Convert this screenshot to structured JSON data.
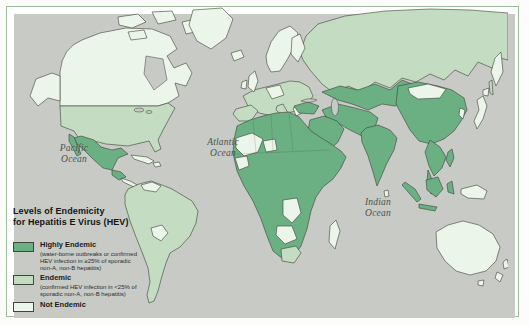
{
  "figure": {
    "type": "choropleth-world-map",
    "subject": "Levels of Endemicity for Hepatitis E Virus (HEV)"
  },
  "legend": {
    "title_line1": "Levels of Endemicity",
    "title_line2": "for Hepatitis E Virus (HEV)",
    "items": [
      {
        "label": "Highly Endemic",
        "description": "(water-borne outbreaks or confirmed HEV infection in ≥25% of sporadic non-A, non-B hepatitis)",
        "color": "#6bb083",
        "level": "high"
      },
      {
        "label": "Endemic",
        "description": "(confirmed HEV infection in <25% of sporadic non-A, non-B hepatitis)",
        "color": "#c4dcc2",
        "level": "endemic"
      },
      {
        "label": "Not Endemic",
        "description": "",
        "color": "#ecf5ea",
        "level": "none"
      }
    ]
  },
  "ocean_labels": [
    {
      "name": "pacific-ocean",
      "line1": "Pacific",
      "line2": "Ocean"
    },
    {
      "name": "atlantic-ocean",
      "line1": "Atlantic",
      "line2": "Ocean"
    },
    {
      "name": "indian-ocean",
      "line1": "Indian",
      "line2": "Ocean"
    }
  ],
  "map": {
    "ocean_color": "#c7cac5",
    "coastline_color": "#3c3f37",
    "frame_color": "#9cbd9c",
    "levels": {
      "high": "#6bb083",
      "endemic": "#c4dcc2",
      "none": "#ecf5ea",
      "water": "#c7cac5"
    },
    "regions": [
      {
        "name": "russia",
        "level": "endemic"
      },
      {
        "name": "kamchatka",
        "level": "none"
      },
      {
        "name": "sakhalin",
        "level": "endemic"
      },
      {
        "name": "europe",
        "level": "endemic"
      },
      {
        "name": "iberia",
        "level": "endemic"
      },
      {
        "name": "italy",
        "level": "endemic"
      },
      {
        "name": "central-europe",
        "level": "none"
      },
      {
        "name": "scandinavia",
        "level": "none"
      },
      {
        "name": "finland",
        "level": "none"
      },
      {
        "name": "uk",
        "level": "none"
      },
      {
        "name": "ireland",
        "level": "none"
      },
      {
        "name": "iceland",
        "level": "none"
      },
      {
        "name": "greece",
        "level": "none"
      },
      {
        "name": "turkey",
        "level": "high"
      },
      {
        "name": "central-asia",
        "level": "high"
      },
      {
        "name": "iran-pakistan",
        "level": "high"
      },
      {
        "name": "arabia",
        "level": "high"
      },
      {
        "name": "china",
        "level": "high"
      },
      {
        "name": "mongolia",
        "level": "none"
      },
      {
        "name": "korea",
        "level": "none"
      },
      {
        "name": "india",
        "level": "high"
      },
      {
        "name": "sri-lanka",
        "level": "none"
      },
      {
        "name": "indochina",
        "level": "high"
      },
      {
        "name": "malay-peninsula",
        "level": "high"
      },
      {
        "name": "japan",
        "level": "none"
      },
      {
        "name": "philippines",
        "level": "high"
      },
      {
        "name": "sumatra",
        "level": "high"
      },
      {
        "name": "java",
        "level": "high"
      },
      {
        "name": "borneo",
        "level": "high"
      },
      {
        "name": "sulawesi",
        "level": "high"
      },
      {
        "name": "new-guinea",
        "level": "none"
      },
      {
        "name": "australia",
        "level": "none"
      },
      {
        "name": "tasmania",
        "level": "none"
      },
      {
        "name": "new-zealand",
        "level": "none"
      },
      {
        "name": "africa",
        "level": "high"
      },
      {
        "name": "sahel-west",
        "level": "none"
      },
      {
        "name": "guinea-coast",
        "level": "none"
      },
      {
        "name": "niger",
        "level": "none"
      },
      {
        "name": "congo",
        "level": "none"
      },
      {
        "name": "angola-zambia",
        "level": "none"
      },
      {
        "name": "south-africa",
        "level": "endemic"
      },
      {
        "name": "madagascar",
        "level": "none"
      },
      {
        "name": "canada",
        "level": "none"
      },
      {
        "name": "arctic-islands",
        "level": "none"
      },
      {
        "name": "greenland",
        "level": "none"
      },
      {
        "name": "alaska",
        "level": "none"
      },
      {
        "name": "usa",
        "level": "endemic"
      },
      {
        "name": "mexico",
        "level": "high"
      },
      {
        "name": "guatemala",
        "level": "high"
      },
      {
        "name": "central-america",
        "level": "none"
      },
      {
        "name": "cuba",
        "level": "none"
      },
      {
        "name": "hispaniola",
        "level": "none"
      },
      {
        "name": "south-america",
        "level": "endemic"
      },
      {
        "name": "venezuela",
        "level": "none"
      },
      {
        "name": "bolivia-paraguay",
        "level": "none"
      },
      {
        "name": "hudson-bay",
        "level": "water"
      },
      {
        "name": "great-lakes",
        "level": "water"
      },
      {
        "name": "black-sea",
        "level": "water"
      },
      {
        "name": "caspian-sea",
        "level": "water"
      }
    ]
  }
}
